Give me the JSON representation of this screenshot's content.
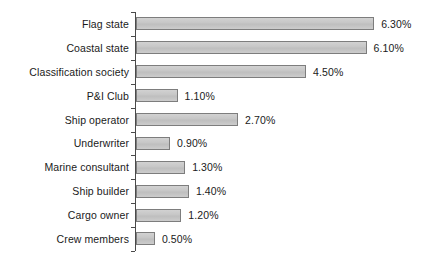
{
  "chart_data": {
    "type": "bar",
    "orientation": "horizontal",
    "title": "",
    "xlabel": "",
    "ylabel": "",
    "xlim": [
      0,
      7
    ],
    "grid": false,
    "legend": null,
    "value_format": "percent",
    "categories": [
      "Flag state",
      "Coastal state",
      "Classification society",
      "P&I Club",
      "Ship operator",
      "Underwriter",
      "Marine consultant",
      "Ship builder",
      "Cargo owner",
      "Crew members"
    ],
    "values": [
      6.3,
      6.1,
      4.5,
      1.1,
      2.7,
      0.9,
      1.3,
      1.4,
      1.2,
      0.5
    ],
    "value_labels": [
      "6.30%",
      "6.10%",
      "4.50%",
      "1.10%",
      "2.70%",
      "0.90%",
      "1.30%",
      "1.40%",
      "1.20%",
      "0.50%"
    ]
  },
  "style": {
    "bar_fill": "#c9c9c9",
    "bar_border": "#7d7d7d",
    "axis_color": "#4a4a4a",
    "text_color": "#1a1a1a",
    "background": "#ffffff"
  }
}
